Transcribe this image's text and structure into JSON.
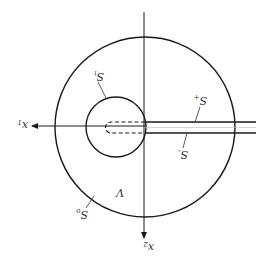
{
  "diagram": {
    "orientation": "rotated-180",
    "axes": {
      "horizontal": {
        "label": "x",
        "subscript": "1"
      },
      "vertical": {
        "label": "x",
        "subscript": "2"
      }
    },
    "labels": {
      "inner_surface": {
        "label": "S",
        "subscript": "i"
      },
      "outer_surface": {
        "label": "S",
        "subscript": "o"
      },
      "slit_upper": {
        "label": "S",
        "subscript": "+"
      },
      "slit_lower": {
        "label": "S",
        "subscript": "-"
      },
      "region": "V"
    },
    "colors": {
      "stroke": "#1a1a1a",
      "background": "#ffffff",
      "text": "#333333"
    }
  }
}
